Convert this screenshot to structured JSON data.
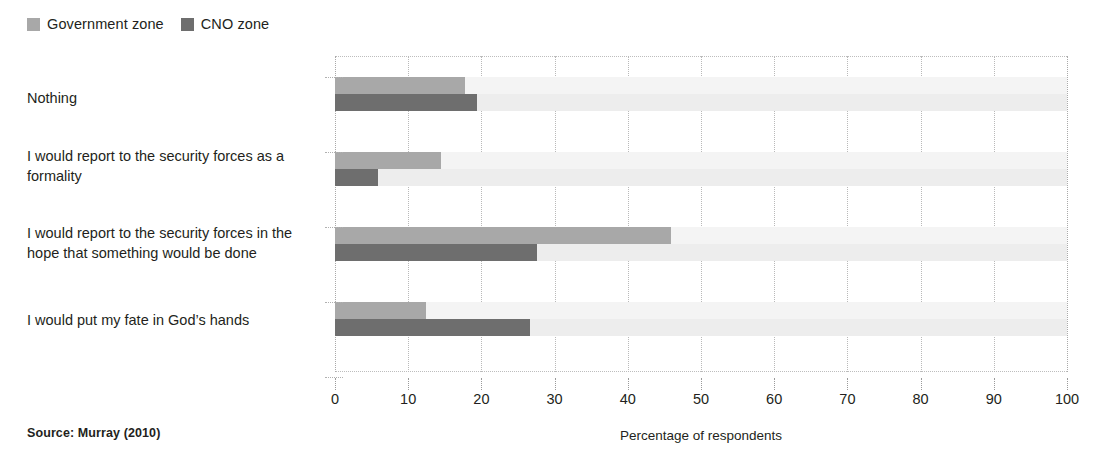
{
  "legend": {
    "items": [
      {
        "label": "Government zone",
        "color": "#a8a8a8",
        "icon": "legend-swatch-icon"
      },
      {
        "label": "CNO zone",
        "color": "#6e6e6e",
        "icon": "legend-swatch-icon"
      }
    ]
  },
  "source": {
    "text": "Source: Murray (2010)"
  },
  "chart_data": {
    "type": "bar",
    "orientation": "horizontal",
    "title": "",
    "subtitle": "",
    "xlabel": "Percentage of respondents",
    "ylabel": "",
    "xlim": [
      0,
      100
    ],
    "xticks": [
      0,
      10,
      20,
      30,
      40,
      50,
      60,
      70,
      80,
      90,
      100
    ],
    "grid": "vertical-dotted",
    "legend_position": "top-left",
    "categories": [
      "Nothing",
      "I would report to the security forces as a formality",
      "I would report to the security forces in the hope that something would be done",
      "I would put my fate in God’s hands"
    ],
    "series": [
      {
        "name": "Government zone",
        "color": "#a8a8a8",
        "values": [
          17.8,
          14.5,
          45.9,
          12.4
        ]
      },
      {
        "name": "CNO zone",
        "color": "#6e6e6e",
        "values": [
          19.4,
          5.9,
          27.6,
          26.6
        ]
      }
    ]
  }
}
